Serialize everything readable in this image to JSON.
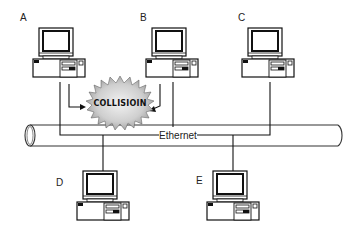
{
  "diagram": {
    "nodes": [
      {
        "id": "A",
        "label": "A"
      },
      {
        "id": "B",
        "label": "B"
      },
      {
        "id": "C",
        "label": "C"
      },
      {
        "id": "D",
        "label": "D"
      },
      {
        "id": "E",
        "label": "E"
      }
    ],
    "bus_label": "Ethernet",
    "collision_label": "COLLISIOIN"
  }
}
